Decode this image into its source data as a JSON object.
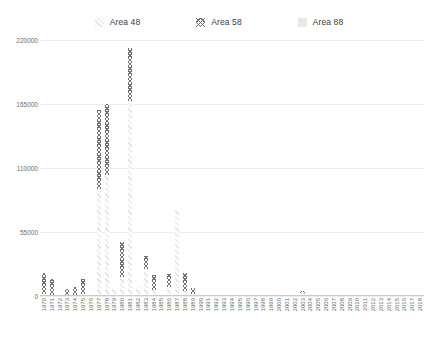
{
  "legend": {
    "position": "top-center",
    "items": [
      {
        "label": "Area 48",
        "swatch": "diagonal-stripe-light",
        "color": "#e2e2e2"
      },
      {
        "label": "Area 58",
        "swatch": "crosshatch-dark",
        "color": "#6f6f6f"
      },
      {
        "label": "Area 88",
        "swatch": "solid-light",
        "color": "#e8e8e8"
      }
    ]
  },
  "chart_data": {
    "type": "bar",
    "stacked": true,
    "title": "",
    "subtitle": "",
    "xlabel": "",
    "ylabel": "",
    "grid": true,
    "ylim": [
      0,
      220000
    ],
    "yticks": [
      0,
      55000,
      110000,
      165000,
      220000
    ],
    "ytick_labels": [
      "0",
      "55000",
      "110000",
      "165000",
      "220000"
    ],
    "categories": [
      "1970",
      "1971",
      "1972",
      "1973",
      "1974",
      "1975",
      "1976",
      "1977",
      "1978",
      "1979",
      "1980",
      "1981",
      "1982",
      "1983",
      "1984",
      "1985",
      "1986",
      "1987",
      "1988",
      "1989",
      "1990",
      "1991",
      "1992",
      "1993",
      "1994",
      "1995",
      "1996",
      "1997",
      "1998",
      "1999",
      "2000",
      "2001",
      "2002",
      "2003",
      "2004",
      "2005",
      "2006",
      "2007",
      "2008",
      "2009",
      "2010",
      "2011",
      "2012",
      "2013",
      "2014",
      "2015",
      "2016",
      "2017",
      "2018"
    ],
    "series": [
      {
        "name": "Area 48",
        "pattern": "diagonal-stripe-light",
        "values": [
          2000,
          1000,
          0,
          0,
          1000,
          2000,
          1000,
          92000,
          104000,
          7000,
          16000,
          168000,
          8000,
          23000,
          5000,
          1000,
          8000,
          74000,
          4000,
          2000,
          1000,
          500,
          500,
          500,
          500,
          400,
          400,
          300,
          300,
          300,
          1500,
          300,
          1200,
          2500,
          1500,
          900,
          700,
          600,
          900,
          600,
          500,
          400,
          300,
          300,
          200,
          200,
          200,
          150,
          150
        ]
      },
      {
        "name": "Area 58",
        "pattern": "crosshatch-dark",
        "values": [
          18000,
          14000,
          0,
          6000,
          7000,
          13000,
          0,
          68000,
          61000,
          0,
          30000,
          45000,
          0,
          11000,
          13000,
          0,
          11000,
          0,
          16000,
          5000,
          0,
          0,
          0,
          0,
          0,
          0,
          0,
          0,
          0,
          0,
          0,
          0,
          0,
          1500,
          0,
          0,
          0,
          0,
          0,
          0,
          0,
          0,
          0,
          0,
          0,
          0,
          0,
          0,
          0
        ]
      },
      {
        "name": "Area 88",
        "pattern": "solid-light",
        "values": [
          0,
          0,
          0,
          0,
          0,
          0,
          0,
          0,
          0,
          0,
          0,
          0,
          0,
          0,
          0,
          0,
          0,
          0,
          0,
          0,
          0,
          0,
          0,
          0,
          0,
          0,
          0,
          0,
          0,
          0,
          0,
          0,
          0,
          0,
          0,
          0,
          0,
          0,
          0,
          0,
          0,
          0,
          0,
          0,
          0,
          0,
          0,
          0,
          0
        ]
      }
    ]
  }
}
